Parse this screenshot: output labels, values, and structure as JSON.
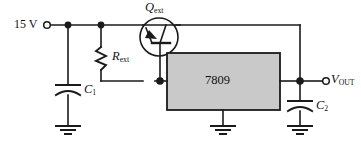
{
  "diagram": {
    "kind": "schematic",
    "title_text": "",
    "background_color": "#ffffff",
    "wire_color": "#1a1a1a",
    "ic_fill_color": "#c9c9c9",
    "ic_border_color": "#1a1a1a"
  },
  "labels": {
    "supply": {
      "text": "15 V",
      "name": "supply-voltage-label"
    },
    "transistor": {
      "base": "Q",
      "sub": "ext",
      "name": "transistor-label"
    },
    "resistor": {
      "base": "R",
      "sub": "ext",
      "name": "resistor-label"
    },
    "cap_in": {
      "base": "C",
      "sub": "1",
      "name": "capacitor-c1-label"
    },
    "cap_out": {
      "base": "C",
      "sub": "2",
      "name": "capacitor-c2-label"
    },
    "regulator": {
      "text": "7809",
      "name": "regulator-part-number"
    },
    "output": {
      "base": "V",
      "sub": "OUT",
      "name": "output-voltage-label"
    }
  },
  "components": [
    {
      "id": "Qext",
      "type": "transistor-pnp",
      "label": "Qext"
    },
    {
      "id": "Rext",
      "type": "resistor",
      "label": "Rext"
    },
    {
      "id": "C1",
      "type": "capacitor",
      "label": "C1"
    },
    {
      "id": "C2",
      "type": "capacitor",
      "label": "C2"
    },
    {
      "id": "U1",
      "type": "voltage-regulator-ic",
      "label": "7809"
    }
  ],
  "terminals": [
    {
      "id": "IN",
      "label": "15 V"
    },
    {
      "id": "OUT",
      "label": "VOUT"
    }
  ],
  "grounds": [
    {
      "id": "GND1",
      "name": "ground-c1"
    },
    {
      "id": "GND2",
      "name": "ground-regulator"
    },
    {
      "id": "GND3",
      "name": "ground-c2"
    }
  ]
}
